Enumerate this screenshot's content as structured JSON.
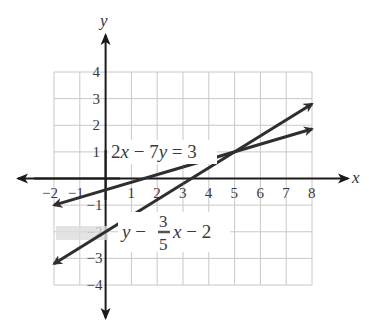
{
  "chart_data": {
    "type": "line",
    "title": "",
    "xlabel": "x",
    "ylabel": "y",
    "xlim": [
      -2,
      8
    ],
    "ylim": [
      -4,
      4
    ],
    "grid": true,
    "x_ticks": [
      "-2",
      "-1",
      "1",
      "2",
      "3",
      "4",
      "5",
      "6",
      "7",
      "8"
    ],
    "y_ticks": [
      "4",
      "3",
      "2",
      "1",
      "-1",
      "-2",
      "-3",
      "-4"
    ],
    "series": [
      {
        "name": "2x − 7y = 3",
        "equation": "2x - 7y = 3",
        "x": [
          -2,
          8
        ],
        "y": [
          -1,
          1.86
        ],
        "arrows": "both"
      },
      {
        "name": "y = (3/5)x − 2",
        "equation": "y = 3/5 x - 2",
        "x": [
          -2,
          8
        ],
        "y": [
          -3.2,
          2.8
        ],
        "arrows": "both"
      }
    ],
    "annotations": [
      {
        "text": "2x − 7y = 3",
        "x": 0.2,
        "y": 0.8
      },
      {
        "text": "y − 3/5 x − 2",
        "x": 0.2,
        "y": -2
      }
    ],
    "intersection": {
      "x": 5,
      "y": 1
    },
    "legend": "none"
  },
  "labels": {
    "x_axis": "x",
    "y_axis": "y",
    "eq1": {
      "a": "2",
      "x": "x",
      "minus": " − 7",
      "y": "y",
      "rest": " = 3"
    },
    "eq2": {
      "y": "y",
      "op": " − ",
      "num": "3",
      "den": "5",
      "x": "x",
      "rest": " − 2"
    }
  },
  "colors": {
    "grid": "#c8c8c8",
    "axis": "#1a1a1a",
    "line": "#2e2e2e",
    "text": "#3a3a3a",
    "smudge": "#d9d9d9"
  }
}
